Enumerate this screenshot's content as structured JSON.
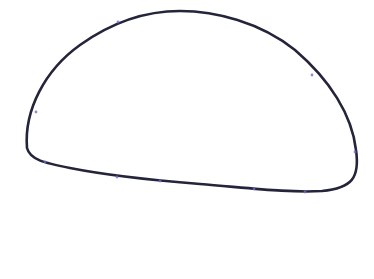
{
  "canvas": {
    "width": 374,
    "height": 279,
    "background": "#ffffff"
  },
  "shape": {
    "type": "closed-freeform-path",
    "stroke": "#24243a",
    "stroke_width": 2.6,
    "fill": "none",
    "path": "M 27 148 C 24 110, 45 70, 80 45 C 115 20, 150 11, 180 11 C 215 11, 260 22, 295 50 C 330 80, 352 115, 356 150 C 360 178, 352 188, 322 191 C 290 193, 250 188, 200 184 C 150 180, 110 176, 70 168 C 45 163, 30 160, 27 148 Z",
    "anchor_color": "#6c6cd8",
    "anchors": [
      {
        "x": 36,
        "y": 112
      },
      {
        "x": 118,
        "y": 22
      },
      {
        "x": 312,
        "y": 75
      },
      {
        "x": 355,
        "y": 152
      },
      {
        "x": 305,
        "y": 192
      },
      {
        "x": 254,
        "y": 189
      },
      {
        "x": 160,
        "y": 181
      },
      {
        "x": 117,
        "y": 177
      },
      {
        "x": 45,
        "y": 162
      }
    ]
  }
}
